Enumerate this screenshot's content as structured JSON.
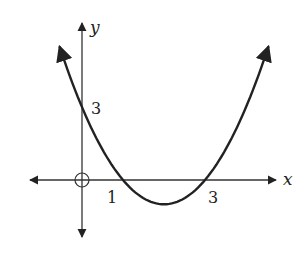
{
  "chart_data": {
    "type": "line",
    "title": "",
    "function": "y = x^2 - 4x + 3",
    "xlabel": "x",
    "ylabel": "y",
    "x_tick_labels": [
      "1",
      "3"
    ],
    "y_tick_labels": [
      "3"
    ],
    "origin_marker": "open circle at origin",
    "roots": [
      1,
      3
    ],
    "y_intercept": 3,
    "vertex": [
      2,
      -1
    ],
    "series": [
      {
        "name": "parabola",
        "x": [
          -0.55,
          0,
          0.5,
          1,
          1.5,
          2,
          2.5,
          3,
          3.5,
          4,
          4.55
        ],
        "values": [
          5.5,
          3,
          1.25,
          0,
          -0.75,
          -1,
          -0.75,
          0,
          1.25,
          3,
          5.5
        ]
      }
    ],
    "xlim": [
      -1.3,
      5.0
    ],
    "ylim": [
      -2.2,
      5.5
    ],
    "grid": false,
    "legend": null,
    "color": "#222222"
  },
  "labels": {
    "x_axis": "x",
    "y_axis": "y",
    "tick_x1": "1",
    "tick_x3": "3",
    "tick_y3": "3"
  }
}
